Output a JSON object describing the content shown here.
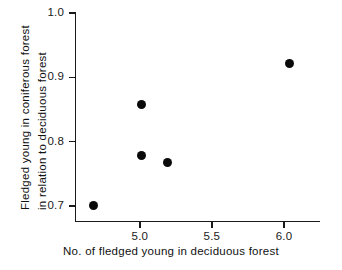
{
  "chart_data": {
    "type": "scatter",
    "title": "",
    "xlabel": "No. of fledged young in deciduous forest",
    "ylabel": "Fledged young in coniferous forest in relation to deciduous forest",
    "ylabel_lines": [
      "Fledged young in coniferous forest",
      "in relation to deciduous forest"
    ],
    "xlim": [
      4.55,
      6.25
    ],
    "ylim": [
      0.675,
      1.0
    ],
    "xticks": [
      5.0,
      5.5,
      6.0
    ],
    "xticklabels": [
      "5.0",
      "5.5",
      "6.0"
    ],
    "yticks": [
      0.7,
      0.8,
      0.9,
      1.0
    ],
    "yticklabels": [
      "0.7",
      "0.8",
      "0.9",
      "1.0"
    ],
    "grid": false,
    "legend": "none",
    "marker": "filled-circle",
    "marker_color": "#0a0a0a",
    "points": [
      {
        "x": 4.68,
        "y": 0.7
      },
      {
        "x": 5.01,
        "y": 0.858
      },
      {
        "x": 5.01,
        "y": 0.779
      },
      {
        "x": 5.19,
        "y": 0.768
      },
      {
        "x": 6.04,
        "y": 0.922
      }
    ],
    "x": [
      4.68,
      5.01,
      5.01,
      5.19,
      6.04
    ],
    "values": [
      0.7,
      0.858,
      0.779,
      0.768,
      0.922
    ]
  },
  "colors": {
    "background": "#ffffff",
    "axis": "#1a1a1a",
    "marker": "#0a0a0a",
    "text": "#111111"
  }
}
